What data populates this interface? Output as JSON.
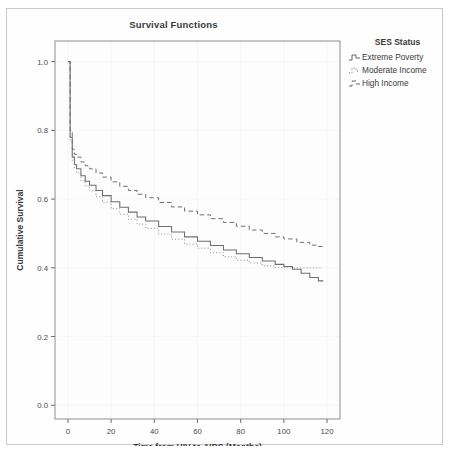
{
  "chart_data": {
    "type": "line",
    "title": "Survival Functions",
    "xlabel": "Time from HIV to AIDS (Months)",
    "ylabel": "Cumulative Survival",
    "xlim": [
      -6,
      126
    ],
    "ylim": [
      -0.04,
      1.06
    ],
    "xticks": [
      0,
      20,
      40,
      60,
      80,
      100,
      120
    ],
    "xtick_labels": [
      "0",
      "20",
      "40",
      "60",
      "80",
      "100",
      "120"
    ],
    "yticks": [
      0.0,
      0.2,
      0.4,
      0.6,
      0.8,
      1.0
    ],
    "ytick_labels": [
      "0.0",
      "0.2",
      "0.4",
      "0.6",
      "0.8",
      "1.0"
    ],
    "grid": true,
    "legend_position": "right",
    "legend_title": "SES Status",
    "series": [
      {
        "name": "Extreme Poverty",
        "style": "solid",
        "color": "#6e6e6e",
        "x": [
          0,
          1,
          2,
          3,
          4,
          6,
          8,
          10,
          13,
          16,
          20,
          24,
          28,
          32,
          36,
          42,
          48,
          54,
          60,
          66,
          72,
          78,
          84,
          90,
          96,
          100,
          104,
          108,
          112,
          116,
          118
        ],
        "y": [
          1.0,
          0.78,
          0.722,
          0.7,
          0.688,
          0.668,
          0.652,
          0.64,
          0.625,
          0.61,
          0.592,
          0.576,
          0.562,
          0.548,
          0.536,
          0.52,
          0.504,
          0.49,
          0.477,
          0.465,
          0.452,
          0.441,
          0.43,
          0.42,
          0.41,
          0.404,
          0.396,
          0.384,
          0.372,
          0.362,
          0.36
        ]
      },
      {
        "name": "Moderate Income",
        "style": "dotted",
        "color": "#8a8a8a",
        "x": [
          0,
          1,
          2,
          3,
          4,
          6,
          8,
          10,
          13,
          16,
          20,
          24,
          28,
          32,
          36,
          42,
          48,
          54,
          60,
          66,
          72,
          78,
          84,
          90,
          96,
          100,
          106,
          112,
          118
        ],
        "y": [
          1.0,
          0.77,
          0.712,
          0.69,
          0.676,
          0.654,
          0.638,
          0.624,
          0.607,
          0.591,
          0.572,
          0.556,
          0.541,
          0.527,
          0.515,
          0.498,
          0.483,
          0.469,
          0.457,
          0.444,
          0.432,
          0.422,
          0.414,
          0.406,
          0.401,
          0.4,
          0.4,
          0.4,
          0.4
        ]
      },
      {
        "name": "High Income",
        "style": "dashed",
        "color": "#707070",
        "x": [
          0,
          1,
          2,
          3,
          4,
          6,
          8,
          10,
          13,
          16,
          20,
          24,
          28,
          32,
          36,
          42,
          48,
          54,
          60,
          66,
          72,
          78,
          84,
          90,
          96,
          100,
          106,
          112,
          116,
          118
        ],
        "y": [
          1.0,
          0.8,
          0.745,
          0.73,
          0.722,
          0.708,
          0.697,
          0.688,
          0.676,
          0.664,
          0.65,
          0.637,
          0.625,
          0.614,
          0.604,
          0.59,
          0.577,
          0.565,
          0.554,
          0.543,
          0.532,
          0.521,
          0.51,
          0.5,
          0.49,
          0.484,
          0.474,
          0.466,
          0.462,
          0.46
        ]
      }
    ]
  },
  "legend": {
    "title": "SES Status",
    "items": [
      {
        "label": "Extreme Poverty",
        "style": "solid"
      },
      {
        "label": "Moderate Income",
        "style": "dotted"
      },
      {
        "label": "High Income",
        "style": "dashed"
      }
    ]
  }
}
